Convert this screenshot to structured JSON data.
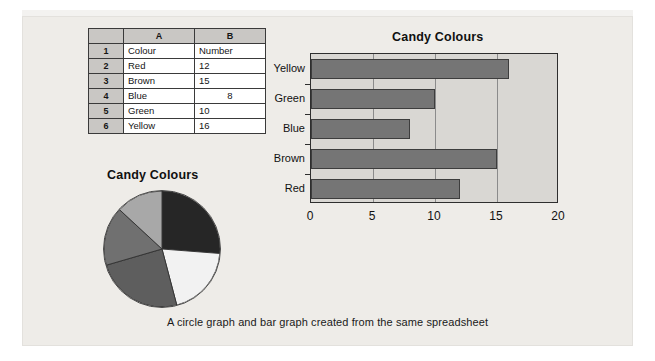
{
  "caption": "A circle graph and bar graph created from the same spreadsheet",
  "spreadsheet": {
    "corner_label": "",
    "column_headers": [
      "A",
      "B"
    ],
    "row_headers": [
      "1",
      "2",
      "3",
      "4",
      "5",
      "6"
    ],
    "rows": [
      {
        "row": "1",
        "a": "Colour",
        "b": "Number"
      },
      {
        "row": "2",
        "a": "Red",
        "b": "12"
      },
      {
        "row": "3",
        "a": "Brown",
        "b": "15"
      },
      {
        "row": "4",
        "a": "Blue",
        "b": "8"
      },
      {
        "row": "5",
        "a": "Green",
        "b": "10"
      },
      {
        "row": "6",
        "a": "Yellow",
        "b": "16"
      }
    ]
  },
  "chart_data": [
    {
      "type": "bar",
      "orientation": "horizontal",
      "title": "Candy Colours",
      "categories": [
        "Red",
        "Brown",
        "Blue",
        "Green",
        "Yellow"
      ],
      "values": [
        12,
        15,
        8,
        10,
        16
      ],
      "xlabel": "",
      "ylabel": "",
      "xlim": [
        0,
        20
      ],
      "xticks": [
        "0",
        "5",
        "10",
        "15",
        "20"
      ],
      "xtick_values": [
        0,
        5,
        10,
        15,
        20
      ],
      "grid": "vertical",
      "legend": "none",
      "bar_color": "#757575",
      "plot_background": "#d9d7d3"
    },
    {
      "type": "pie",
      "title": "Candy Colours",
      "labels": [
        "Red",
        "Brown",
        "Blue",
        "Green",
        "Yellow"
      ],
      "values": [
        12,
        15,
        8,
        10,
        16
      ],
      "total": 61,
      "percentages": [
        "19.7",
        "24.6",
        "13.1",
        "16.4",
        "26.2"
      ],
      "slice_colors": [
        "#f2f2f2",
        "#5e5e5e",
        "#a8a8a8",
        "#707070",
        "#262626"
      ],
      "legend": "none"
    }
  ]
}
